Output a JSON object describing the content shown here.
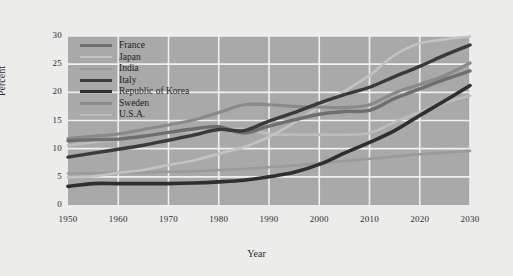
{
  "chart_data": {
    "type": "line",
    "title": "",
    "xlabel": "Year",
    "ylabel": "Percent",
    "xlim": [
      1950,
      2030
    ],
    "ylim": [
      0,
      30
    ],
    "xticks": [
      "1950",
      "1960",
      "1970",
      "1980",
      "1990",
      "2000",
      "2010",
      "2020",
      "2030"
    ],
    "yticks": [
      "0",
      "5",
      "10",
      "15",
      "20",
      "25",
      "30"
    ],
    "grid": true,
    "legend_position": "top-left",
    "x": [
      1950,
      1955,
      1960,
      1965,
      1970,
      1975,
      1980,
      1985,
      1990,
      1995,
      2000,
      2005,
      2010,
      2015,
      2020,
      2025,
      2030
    ],
    "series": [
      {
        "name": "France",
        "color": "#6e6e6e",
        "values": [
          11.4,
          11.6,
          11.7,
          12.2,
          12.9,
          13.5,
          13.9,
          12.8,
          14.0,
          15.1,
          16.1,
          16.6,
          16.8,
          18.9,
          20.6,
          22.3,
          23.8
        ]
      },
      {
        "name": "Japan",
        "color": "#c3c3c3",
        "values": [
          4.9,
          5.1,
          5.7,
          6.2,
          7.1,
          7.9,
          9.1,
          10.3,
          12.1,
          14.6,
          17.4,
          20.2,
          23.0,
          26.6,
          28.7,
          29.4,
          29.9
        ]
      },
      {
        "name": "India",
        "color": "#9a9a9a",
        "values": [
          5.6,
          5.6,
          5.7,
          5.8,
          5.9,
          6.0,
          6.2,
          6.4,
          6.7,
          7.0,
          7.4,
          7.8,
          8.2,
          8.6,
          9.0,
          9.3,
          9.6
        ]
      },
      {
        "name": "Italy",
        "color": "#3a3a3a",
        "values": [
          8.5,
          9.2,
          9.9,
          10.6,
          11.5,
          12.4,
          13.4,
          13.2,
          14.9,
          16.4,
          18.1,
          19.6,
          20.9,
          22.8,
          24.6,
          26.6,
          28.4
        ]
      },
      {
        "name": "Republic of Korea",
        "color": "#2f2f2f",
        "values": [
          3.3,
          3.8,
          3.8,
          3.8,
          3.8,
          3.9,
          4.1,
          4.4,
          5.0,
          5.8,
          7.2,
          9.2,
          11.1,
          13.2,
          15.9,
          18.5,
          21.2
        ]
      },
      {
        "name": "Sweden",
        "color": "#8a8a8a",
        "values": [
          11.8,
          12.2,
          12.6,
          13.4,
          14.2,
          15.1,
          16.4,
          17.8,
          17.8,
          17.5,
          17.4,
          17.3,
          17.8,
          19.9,
          21.4,
          23.0,
          25.2
        ]
      },
      {
        "name": "U.S.A.",
        "color": "#bdbdbd",
        "values": [
          10.6,
          11.1,
          11.6,
          12.2,
          12.9,
          13.1,
          13.3,
          13.5,
          12.6,
          12.5,
          12.5,
          12.5,
          12.8,
          14.7,
          16.5,
          18.2,
          19.4
        ]
      }
    ]
  },
  "legend": {
    "items": [
      {
        "label": "France",
        "color": "#6e6e6e",
        "weight": 3.4
      },
      {
        "label": "Japan",
        "color": "#c3c3c3",
        "weight": 2.6
      },
      {
        "label": "India",
        "color": "#9a9a9a",
        "weight": 2.6
      },
      {
        "label": "Italy",
        "color": "#3a3a3a",
        "weight": 3.4
      },
      {
        "label": "Republic of Korea",
        "color": "#2f2f2f",
        "weight": 3.6
      },
      {
        "label": "Sweden",
        "color": "#8a8a8a",
        "weight": 3.2
      },
      {
        "label": "U.S.A.",
        "color": "#bdbdbd",
        "weight": 2.6
      }
    ]
  },
  "axes": {
    "x_title": "Year",
    "y_title": "Percent"
  },
  "colors": {
    "figure_background": "#ececeb",
    "plot_background": "#a9a9a9",
    "gridline": "#f0f0f0",
    "tick_text": "#2b2b2b"
  }
}
